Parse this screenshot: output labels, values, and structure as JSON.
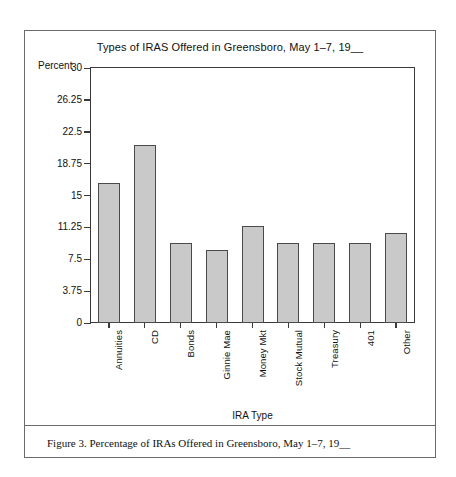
{
  "figure": {
    "caption": "Figure 3. Percentage of IRAs Offered in Greensboro, May 1–7, 19__"
  },
  "chart_data": {
    "type": "bar",
    "title": "Types of IRAS Offered in Greensboro, May 1–7, 19__",
    "xlabel": "IRA Type",
    "ylabel": "Percent",
    "categories": [
      "Annuities",
      "CD",
      "Bonds",
      "Ginnie Mae",
      "Money Mkt",
      "Stock Mutual",
      "Treasury",
      "401",
      "Other"
    ],
    "values": [
      16.5,
      21.0,
      9.4,
      8.6,
      11.4,
      9.4,
      9.4,
      9.4,
      10.6
    ],
    "ylim": [
      0,
      30
    ],
    "yticks": [
      0,
      3.75,
      7.5,
      11.25,
      15,
      18.75,
      22.5,
      26.25,
      30
    ],
    "ytick_labels": [
      "0",
      "3.75",
      "7.5",
      "11.25",
      "15",
      "18.75",
      "22.5",
      "26.25",
      "30"
    ],
    "grid": false,
    "legend": "none",
    "bar_color": "#c9c9c9",
    "bar_edge_color": "#4a4a4a",
    "axis_color": "#3a3a3a",
    "frame_color": "#6b6b6b",
    "background": "#ffffff"
  }
}
